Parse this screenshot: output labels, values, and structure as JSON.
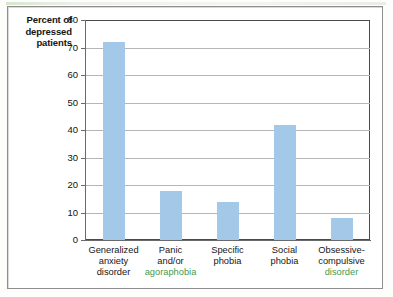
{
  "chart_data": {
    "type": "bar",
    "title": "",
    "xlabel": "",
    "ylabel": "Percent of depressed patients",
    "ylim": [
      0,
      80
    ],
    "ytick_step": 10,
    "yticks": [
      "0",
      "10",
      "20",
      "30",
      "40",
      "50",
      "60",
      "70",
      "80"
    ],
    "grid": true,
    "legend": "none",
    "bar_color": "#a4c8e8",
    "categories": [
      "Generalized anxiety disorder",
      "Panic and/or agoraphobia",
      "Specific phobia",
      "Social phobia",
      "Obsessive-compulsive disorder"
    ],
    "values": [
      72,
      18,
      14,
      42,
      8
    ]
  },
  "y_axis_title": {
    "line1": "Percent of",
    "line2": "depressed",
    "line3": "patients"
  },
  "category_labels": [
    {
      "line1": "Generalized",
      "line2": "anxiety",
      "line3": "disorder",
      "tinted_line": 0
    },
    {
      "line1": "Panic",
      "line2": "and/or",
      "line3": "agoraphobia",
      "tinted_line": 3
    },
    {
      "line1": "Specific",
      "line2": "phobia",
      "line3": "",
      "tinted_line": 0
    },
    {
      "line1": "Social",
      "line2": "phobia",
      "line3": "",
      "tinted_line": 0
    },
    {
      "line1": "Obsessive-",
      "line2": "compulsive",
      "line3": "disorder",
      "tinted_line": 3
    }
  ]
}
